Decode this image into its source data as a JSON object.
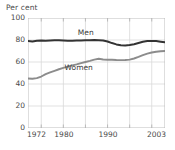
{
  "chart_data": {
    "type": "line",
    "title": "",
    "ylabel": "Per cent",
    "xlabel": "",
    "ylim": [
      0,
      100
    ],
    "xlim": [
      1972,
      2003
    ],
    "yticks": [
      0,
      20,
      40,
      60,
      80,
      100
    ],
    "ytick_labels": [
      "0",
      "20",
      "40",
      "60",
      "80",
      "100"
    ],
    "xticks": [
      1972,
      1980,
      1990,
      2003
    ],
    "xtick_labels": [
      "1972",
      "1980",
      "1990",
      "2003"
    ],
    "gridlines_x": [
      1975,
      1980,
      1985,
      1990,
      1995,
      2000
    ],
    "grid": true,
    "legend_position": "inline-annotation",
    "x": [
      1972,
      1973,
      1974,
      1975,
      1976,
      1977,
      1978,
      1979,
      1980,
      1981,
      1982,
      1983,
      1984,
      1985,
      1986,
      1987,
      1988,
      1989,
      1990,
      1991,
      1992,
      1993,
      1994,
      1995,
      1996,
      1997,
      1998,
      1999,
      2000,
      2001,
      2002,
      2003
    ],
    "series": [
      {
        "name": "Men",
        "color": "#333333",
        "label_x": 1986,
        "label_y": 86,
        "values": [
          79.0,
          78.6,
          79.3,
          79.5,
          79.4,
          79.6,
          79.7,
          79.8,
          79.6,
          79.4,
          79.3,
          79.5,
          79.6,
          79.7,
          79.8,
          79.9,
          79.8,
          79.5,
          78.6,
          77.2,
          76.0,
          75.2,
          75.0,
          75.4,
          76.2,
          77.3,
          78.4,
          79.0,
          79.2,
          79.0,
          78.5,
          78.0
        ]
      },
      {
        "name": "Women",
        "color": "#8c8c8c",
        "label_x": 1983,
        "label_y": 55,
        "values": [
          45.0,
          44.8,
          45.3,
          46.8,
          49.0,
          50.6,
          52.0,
          53.4,
          54.6,
          55.8,
          56.9,
          57.9,
          59.0,
          60.0,
          61.0,
          62.2,
          62.9,
          62.3,
          62.0,
          62.0,
          61.8,
          61.7,
          61.8,
          62.2,
          63.2,
          64.6,
          66.2,
          67.6,
          68.6,
          69.3,
          69.8,
          70.0
        ]
      }
    ]
  },
  "style": {
    "grid_color": "#d9d9d9",
    "axis_color": "#b5b5b5",
    "text_color": "#4a4a4a",
    "background": "#ffffff"
  }
}
